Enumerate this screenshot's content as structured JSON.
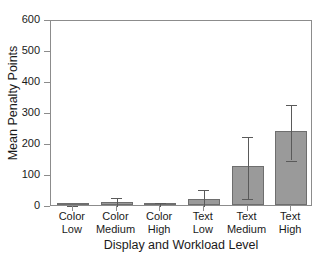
{
  "chart_data": {
    "type": "bar",
    "title": "",
    "xlabel": "Display and Workload Level",
    "ylabel": "Mean Penalty Points",
    "categories": [
      "Color Low",
      "Color Medium",
      "Color High",
      "Text Low",
      "Text Medium",
      "Text High"
    ],
    "category_lines": [
      [
        "Color",
        "Low"
      ],
      [
        "Color",
        "Medium"
      ],
      [
        "Color",
        "High"
      ],
      [
        "Text",
        "Low"
      ],
      [
        "Text",
        "Medium"
      ],
      [
        "Text",
        "High"
      ]
    ],
    "values": [
      1,
      10,
      5,
      20,
      125,
      240
    ],
    "errors": [
      3,
      18,
      8,
      35,
      100,
      90
    ],
    "error_type": "symmetric",
    "ylim": [
      0,
      600
    ],
    "yticks": [
      0,
      100,
      200,
      300,
      400,
      500,
      600
    ],
    "ytick_labels": [
      "0",
      "100",
      "200",
      "300",
      "400",
      "500",
      "600"
    ],
    "grid": false,
    "legend": null,
    "bar_color": "#9a9a9a",
    "bar_edge_color": "#6e6e6e",
    "error_color": "#5a5a5a",
    "axis_color": "#8c8c8c"
  },
  "axis": {
    "y_title": "Mean Penalty Points",
    "x_title": "Display and Workload Level"
  }
}
